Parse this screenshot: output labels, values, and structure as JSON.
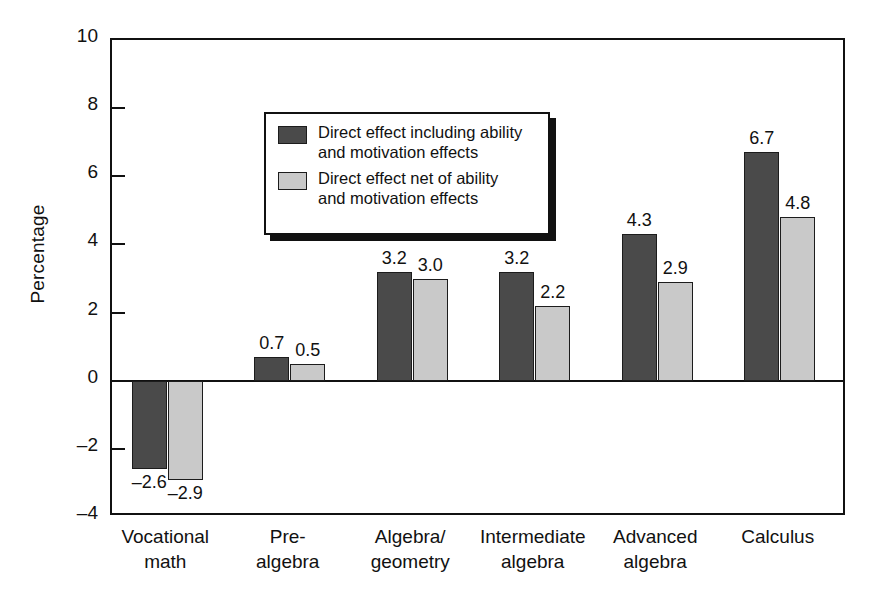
{
  "chart_data": {
    "type": "bar",
    "title": "",
    "xlabel": "",
    "ylabel": "Percentage",
    "ylim": [
      -4,
      10
    ],
    "yticks": [
      10,
      8,
      6,
      4,
      2,
      0,
      -2,
      -4
    ],
    "ytick_labels": [
      "10",
      "8",
      "6",
      "4",
      "2",
      "0",
      "–2",
      "–4"
    ],
    "grid": false,
    "legend_position": "upper left",
    "categories": [
      "Vocational\nmath",
      "Pre-\nalgebra",
      "Algebra/\ngeometry",
      "Intermediate\nalgebra",
      "Advanced\nalgebra",
      "Calculus"
    ],
    "category_lines": [
      [
        "Vocational",
        "math"
      ],
      [
        "Pre-",
        "algebra"
      ],
      [
        "Algebra/",
        "geometry"
      ],
      [
        "Intermediate",
        "algebra"
      ],
      [
        "Advanced",
        "algebra"
      ],
      [
        "Calculus",
        ""
      ]
    ],
    "series": [
      {
        "name": "Direct effect including ability and motivation effects",
        "color": "#4a4a4a",
        "values": [
          -2.6,
          0.7,
          3.2,
          3.2,
          4.3,
          6.7
        ],
        "labels": [
          "–2.6",
          "0.7",
          "3.2",
          "3.2",
          "4.3",
          "6.7"
        ]
      },
      {
        "name": "Direct effect net of ability and motivation effects",
        "color": "#c9c9c9",
        "values": [
          -2.9,
          0.5,
          3.0,
          2.2,
          2.9,
          4.8
        ],
        "labels": [
          "–2.9",
          "0.5",
          "3.0",
          "2.2",
          "2.9",
          "4.8"
        ]
      }
    ]
  },
  "legend": {
    "entries": [
      {
        "icon": "dark-swatch",
        "line1": "Direct effect including ability",
        "line2": "and motivation effects"
      },
      {
        "icon": "light-swatch",
        "line1": "Direct effect net of ability",
        "line2": "and motivation effects"
      }
    ]
  },
  "colors": {
    "series_dark": "#4a4a4a",
    "series_light": "#c9c9c9",
    "axis": "#111111",
    "background": "#ffffff"
  }
}
